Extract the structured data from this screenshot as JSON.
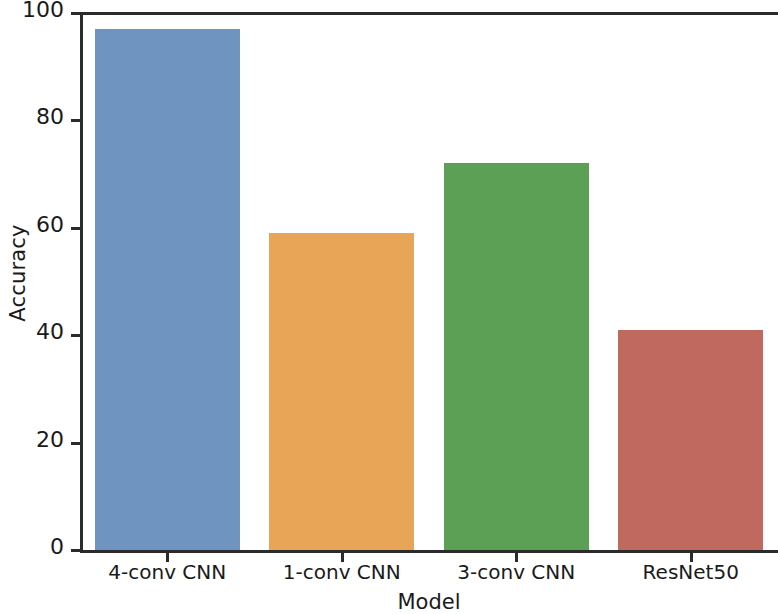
{
  "chart_data": {
    "type": "bar",
    "title": "",
    "subtitle": "",
    "xlabel": "Model",
    "ylabel": "Accuracy",
    "categories": [
      "4-conv CNN",
      "1-conv CNN",
      "3-conv CNN",
      "ResNet50"
    ],
    "values": [
      97,
      59,
      72,
      41
    ],
    "series": [
      {
        "name": "Accuracy",
        "values": [
          97,
          59,
          72,
          41
        ]
      }
    ],
    "colors": [
      "#6f94c0",
      "#e8a457",
      "#5ba055",
      "#c0695e"
    ],
    "ylim": [
      0,
      100
    ],
    "yticks": [
      0,
      20,
      40,
      60,
      80,
      100
    ],
    "ytick_labels": [
      "0",
      "20",
      "40",
      "60",
      "80",
      "100"
    ],
    "xtick_labels": [
      "4-conv CNN",
      "1-conv CNN",
      "3-conv CNN",
      "ResNet50"
    ],
    "grid": false,
    "legend": false,
    "legend_position": "none",
    "annotations": []
  },
  "figure": {
    "background_color": "#ffffff",
    "axis_color": "#2b2b2b",
    "text_color": "#1a1a1a"
  }
}
